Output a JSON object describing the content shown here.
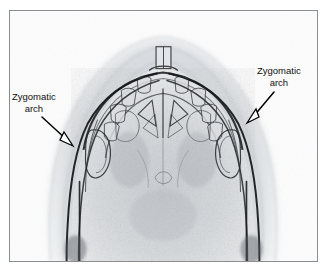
{
  "figure": {
    "type": "radiograph",
    "view": "submentovertex (base of skull) projection",
    "frame_color": "#8a8d92",
    "background_color": "#ffffff"
  },
  "annotations": [
    {
      "id": "zygomatic-arch-left",
      "label_line1": "Zygomatic",
      "label_line2": "arch",
      "text_x": 12,
      "text_y": 91,
      "arrow": {
        "style": "hollow-triangle-head",
        "stroke_color": "#000000",
        "fill_color": "#ffffff",
        "from_x": 42,
        "from_y": 117,
        "to_x": 73,
        "to_y": 146
      }
    },
    {
      "id": "zygomatic-arch-right",
      "label_line1": "Zygomatic",
      "label_line2": "arch",
      "text_x": 257,
      "text_y": 65,
      "arrow": {
        "style": "hollow-triangle-head",
        "stroke_color": "#000000",
        "fill_color": "#ffffff",
        "from_x": 274,
        "from_y": 92,
        "to_x": 247,
        "to_y": 123
      }
    }
  ],
  "image_colors": {
    "bone_dark": "#1d1f22",
    "bone_mid": "#6d7176",
    "soft_tissue": "#b9bcc0",
    "film_background": "#fbfbfb"
  }
}
